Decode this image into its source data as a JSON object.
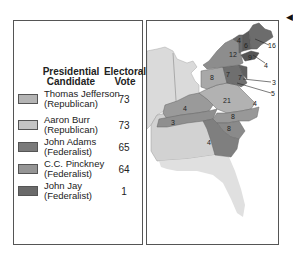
{
  "legend": {
    "header_candidate": "Presidential Candidate",
    "header_candidate_l1": "Presidential",
    "header_candidate_l2": "Candidate",
    "header_vote_l1": "Electoral",
    "header_vote_l2": "Vote",
    "rows": [
      {
        "name": "Thomas Jefferson",
        "party": "(Republican)",
        "votes": "73",
        "color": "#b4b4b4"
      },
      {
        "name": "Aaron Burr",
        "party": "(Republican)",
        "votes": "73",
        "color": "#c4c4c4"
      },
      {
        "name": "John Adams",
        "party": "(Federalist)",
        "votes": "65",
        "color": "#7a7a7a"
      },
      {
        "name": "C.C. Pinckney",
        "party": "(Federalist)",
        "votes": "64",
        "color": "#959595"
      },
      {
        "name": "John Jay",
        "party": "(Federalist)",
        "votes": "1",
        "color": "#6a6a6a"
      }
    ]
  },
  "map": {
    "state_labels": [
      {
        "text": "4",
        "x": 90,
        "y": 22
      },
      {
        "text": "6",
        "x": 98,
        "y": 26
      },
      {
        "text": "16",
        "x": 123,
        "y": 24
      },
      {
        "text": "12",
        "x": 84,
        "y": 33
      },
      {
        "text": "9",
        "x": 103,
        "y": 37
      },
      {
        "text": "4",
        "x": 119,
        "y": 43
      },
      {
        "text": "8",
        "x": 64,
        "y": 55
      },
      {
        "text": "7",
        "x": 78,
        "y": 53
      },
      {
        "text": "7",
        "x": 91,
        "y": 58
      },
      {
        "text": "3",
        "x": 126,
        "y": 62
      },
      {
        "text": "5",
        "x": 126,
        "y": 73
      },
      {
        "text": "21",
        "x": 67,
        "y": 82
      },
      {
        "text": "4",
        "x": 104,
        "y": 82
      },
      {
        "text": "4",
        "x": 33,
        "y": 84
      },
      {
        "text": "8",
        "x": 81,
        "y": 97
      },
      {
        "text": "3",
        "x": 27,
        "y": 99
      },
      {
        "text": "8",
        "x": 78,
        "y": 108
      },
      {
        "text": "4",
        "x": 64,
        "y": 123
      }
    ]
  },
  "colors": {
    "frame": "#555555",
    "land_light": "#d6d6d6",
    "republican": "#b8b8b8",
    "federalist": "#7d7d7d",
    "water": "#ffffff"
  }
}
